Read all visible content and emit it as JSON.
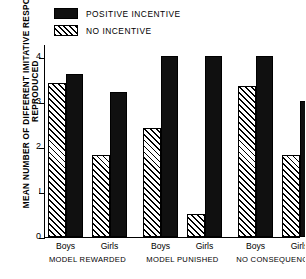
{
  "chart_data": {
    "type": "bar",
    "title": "",
    "xlabel": "",
    "ylabel": "MEAN NUMBER OF DIFFERENT IMITATIVE RESPONSES",
    "ylabel_line2": "REPRODUCED",
    "ylim": [
      0,
      4.25
    ],
    "yticks": [
      0,
      1,
      2,
      3,
      4
    ],
    "ytick_labels": [
      "0",
      "I",
      "2",
      "3",
      "4"
    ],
    "grid": false,
    "legend_position": "top-left",
    "categories": [
      "Boys",
      "Girls",
      "Boys",
      "Girls",
      "Boys",
      "Girls"
    ],
    "groups": [
      {
        "condition": "MODEL REWARDED",
        "cond_word1": "MODEL",
        "cond_word2": "REWARDED",
        "bars": [
          {
            "sex": "Boys",
            "no_incentive": 3.4,
            "positive_incentive": 3.6
          },
          {
            "sex": "Girls",
            "no_incentive": 1.8,
            "positive_incentive": 3.2
          }
        ]
      },
      {
        "condition": "MODEL PUNISHED",
        "cond_word1": "MODEL",
        "cond_word2": "PUNISHED",
        "bars": [
          {
            "sex": "Boys",
            "no_incentive": 2.4,
            "positive_incentive": 4.0
          },
          {
            "sex": "Girls",
            "no_incentive": 0.5,
            "positive_incentive": 4.0
          }
        ]
      },
      {
        "condition": "NO CONSEQUENCES",
        "cond_word1": "NO",
        "cond_word2": "CONSEQUENCES",
        "bars": [
          {
            "sex": "Boys",
            "no_incentive": 3.35,
            "positive_incentive": 4.0
          },
          {
            "sex": "Girls",
            "no_incentive": 1.8,
            "positive_incentive": 3.0
          }
        ]
      }
    ],
    "series": [
      {
        "name": "POSITIVE INCENTIVE",
        "fill": "solid",
        "color": "#101010",
        "values": [
          3.6,
          3.2,
          4.0,
          4.0,
          4.0,
          3.0
        ]
      },
      {
        "name": "NO INCENTIVE",
        "fill": "hatched",
        "color": "#ffffff",
        "values": [
          3.4,
          1.8,
          2.4,
          0.5,
          3.35,
          1.8
        ]
      }
    ]
  },
  "legend": {
    "items": [
      {
        "label": "POSITIVE INCENTIVE",
        "swatch": "solid-black-swatch"
      },
      {
        "label": "NO INCENTIVE",
        "swatch": "hatched-swatch"
      }
    ]
  }
}
